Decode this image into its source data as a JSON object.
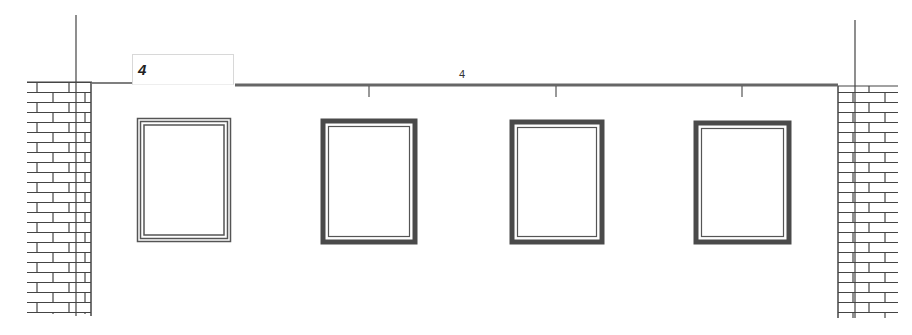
{
  "drawing": {
    "type": "wall-elevation",
    "window_count_input": {
      "value": "4"
    },
    "dimension_label": "4",
    "colors": {
      "line": "#444444",
      "wall_line": "#555555",
      "brick": "#444444",
      "frame_dark": "#4a4a4a",
      "background": "#ffffff"
    },
    "windows": [
      {
        "id": 1,
        "style": "selected-outline"
      },
      {
        "id": 2,
        "style": "solid"
      },
      {
        "id": 3,
        "style": "solid"
      },
      {
        "id": 4,
        "style": "solid"
      }
    ]
  }
}
